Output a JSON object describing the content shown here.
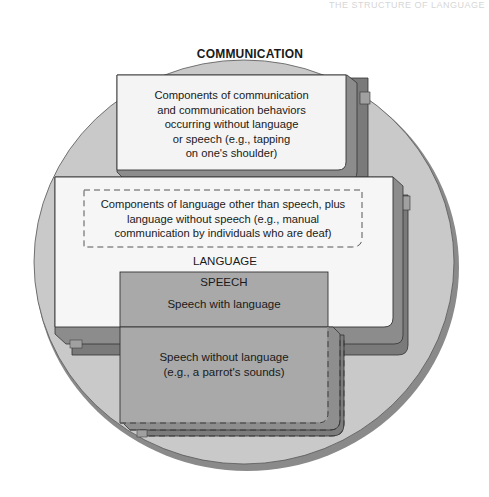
{
  "page": {
    "running_header": "THE STRUCTURE OF LANGUAGE"
  },
  "diagram": {
    "outer": {
      "title": "COMMUNICATION",
      "shape": "circle"
    },
    "communication_only_box": {
      "lines": [
        "Components of communication",
        "and communication behaviors",
        "occurring without language",
        "or speech (e.g., tapping",
        "on one's shoulder)"
      ]
    },
    "language_box": {
      "title": "LANGUAGE",
      "inner_dashed_box": {
        "lines": [
          "Components of language other than speech, plus",
          "language without speech (e.g., manual",
          "communication by individuals who are deaf)"
        ]
      }
    },
    "speech_box": {
      "title": "SPEECH",
      "with_language": "Speech with  language",
      "without_language_lines": [
        "Speech without language",
        "(e.g., a parrot's sounds)"
      ]
    },
    "colors": {
      "circle_fill": "#c8c8c8",
      "circle_rim": "#8a8a8a",
      "box_face": "#f4f4f4",
      "box_side": "#8c8c8c",
      "box_shadow": "#7a7a7a",
      "speech_fill": "#a9a9a9",
      "outline": "#333333"
    }
  }
}
